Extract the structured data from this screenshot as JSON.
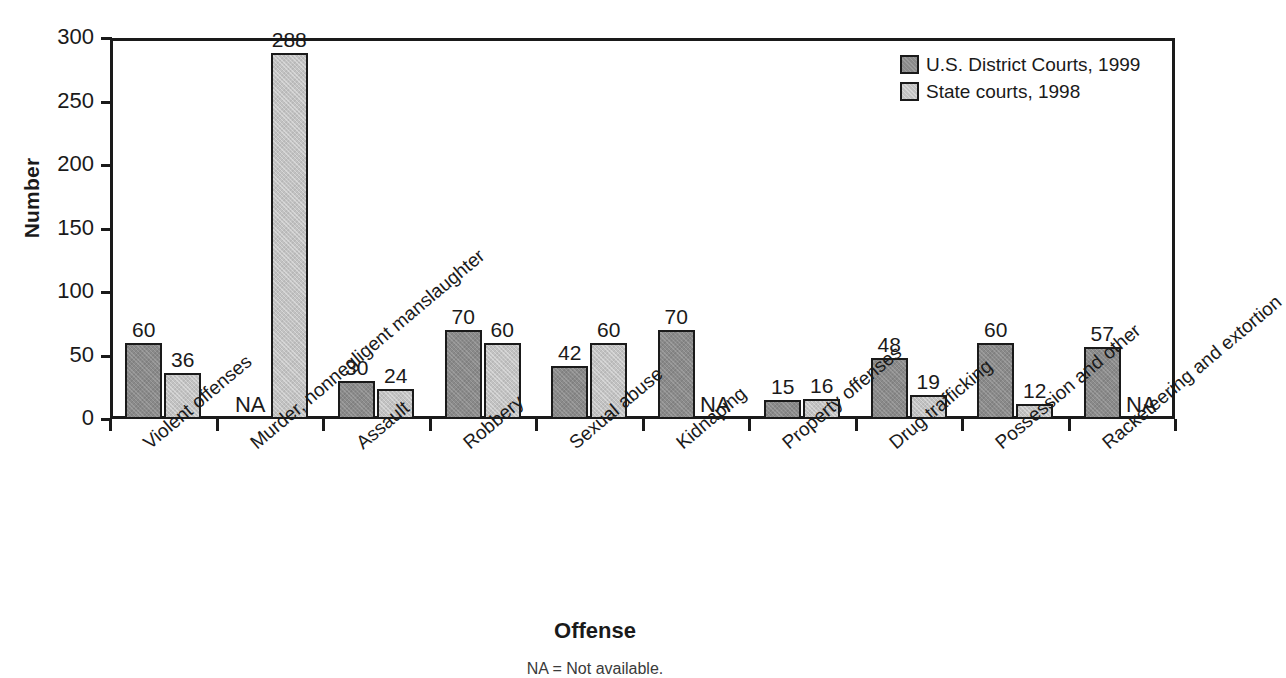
{
  "chart_data": {
    "type": "bar",
    "title": "",
    "xlabel": "Offense",
    "ylabel": "Number",
    "ylim": [
      0,
      300
    ],
    "ytick_values": [
      300,
      250,
      200,
      150,
      100,
      50,
      0
    ],
    "ytick_labels": [
      "300",
      "250",
      "200",
      "150",
      "100",
      "50",
      "0"
    ],
    "grid": false,
    "legend_position": "top-right",
    "categories": [
      "Violent offenses",
      "Murder, nonnegligent manslaughter",
      "Assault",
      "Robbery",
      "Sexual abuse",
      "Kidnaping",
      "Property offenses",
      "Drug trafficking",
      "Possession and other",
      "Racketeering and extortion"
    ],
    "series": [
      {
        "name": "U.S. District Courts, 1999",
        "color": "#8a8a8a",
        "values": [
          60,
          null,
          30,
          70,
          42,
          70,
          15,
          48,
          60,
          57
        ],
        "labels": [
          "60",
          "NA",
          "30",
          "70",
          "42",
          "70",
          "15",
          "48",
          "60",
          "57"
        ]
      },
      {
        "name": "State courts, 1998",
        "color": "#c2c2c2",
        "values": [
          36,
          288,
          24,
          60,
          60,
          null,
          16,
          19,
          12,
          null
        ],
        "labels": [
          "36",
          "288",
          "24",
          "60",
          "60",
          "NA",
          "16",
          "19",
          "12",
          ""
        ]
      }
    ],
    "missing_marker": "NA",
    "footnote": "NA = Not available."
  }
}
